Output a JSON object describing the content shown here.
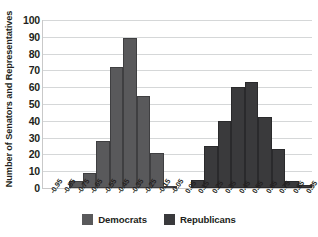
{
  "chart_data": {
    "type": "bar",
    "title": "",
    "subtitle": "",
    "xlabel": "",
    "ylabel": "Number of Senators and Representatives",
    "categories": [
      "-0.95",
      "-0.85",
      "-0.75",
      "-0.65",
      "-0.55",
      "-0.45",
      "-0.35",
      "-0.25",
      "-0.15",
      "-0.05",
      "0.05",
      "0.15",
      "0.25",
      "0.35",
      "0.45",
      "0.55",
      "0.65",
      "0.75",
      "0.85",
      "0.95"
    ],
    "series": [
      {
        "name": "Democrats",
        "color": "#59595b",
        "values": [
          0,
          0,
          4,
          9,
          28,
          72,
          89,
          55,
          21,
          1,
          0,
          0,
          0,
          0,
          0,
          0,
          0,
          0,
          0,
          0
        ]
      },
      {
        "name": "Republicans",
        "color": "#3a3a3c",
        "values": [
          0,
          0,
          0,
          0,
          0,
          0,
          0,
          0,
          0,
          0,
          0,
          5,
          25,
          40,
          60,
          63,
          42,
          23,
          4,
          2
        ]
      }
    ],
    "ylim": [
      0,
      100
    ],
    "ytick_step": 10,
    "yticks": [
      0,
      10,
      20,
      30,
      40,
      50,
      60,
      70,
      80,
      90,
      100
    ],
    "grid": "horizontal",
    "legend_position": "bottom",
    "xtick_rotation": -55
  },
  "legend": {
    "items": [
      {
        "label": "Democrats",
        "color": "#59595b"
      },
      {
        "label": "Republicans",
        "color": "#3a3a3c"
      }
    ]
  },
  "colors": {
    "democrat": "#59595b",
    "republican": "#3a3a3c",
    "gridline": "#d5d7d8",
    "axis": "#c9c9c9",
    "text": "#231f20",
    "background": "#ffffff"
  }
}
